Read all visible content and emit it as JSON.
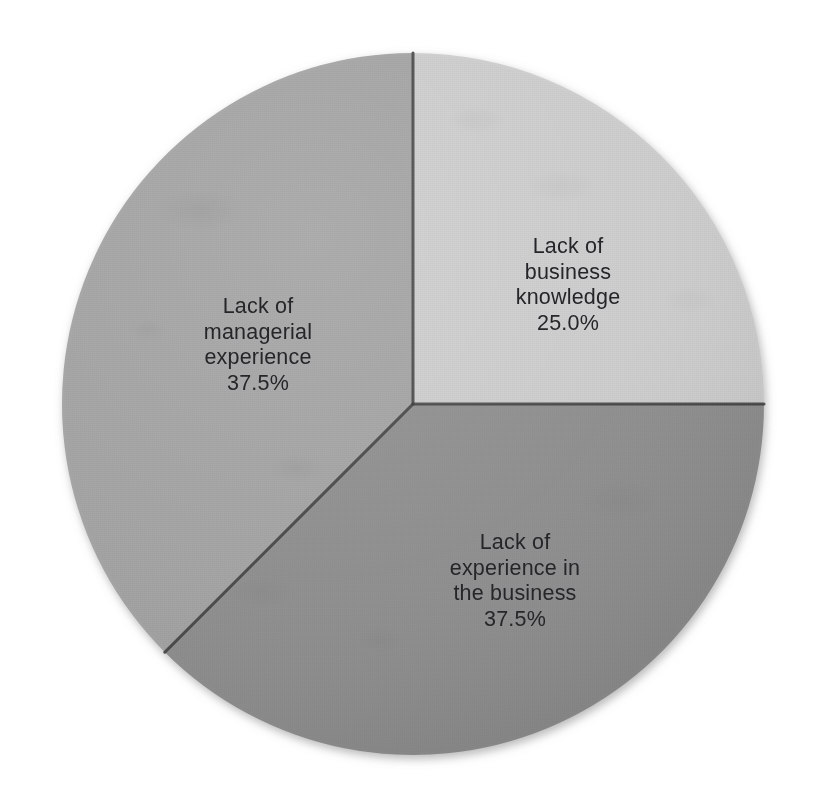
{
  "chart_data": {
    "type": "pie",
    "title": "",
    "subtitle": "",
    "xlabel": "",
    "ylabel": "",
    "legend_position": "none",
    "grid": false,
    "start_angle_deg": 0,
    "direction": "clockwise",
    "categories": [
      "Lack of business knowledge",
      "Lack of experience in the business",
      "Lack of managerial experience"
    ],
    "values": [
      25.0,
      37.5,
      37.5
    ],
    "value_labels": [
      "25.0%",
      "37.5%",
      "37.5%"
    ],
    "colors": [
      "#cdcdcd",
      "#8e8e8e",
      "#a3a3a3"
    ],
    "slices": [
      {
        "label": "Lack of business knowledge",
        "label_lines": [
          "Lack of",
          "business",
          "knowledge"
        ],
        "value": 25.0,
        "value_label": "25.0%",
        "color": "#cdcdcd",
        "start_angle_deg": 0,
        "end_angle_deg": 90,
        "label_x": 568,
        "label_y": 285
      },
      {
        "label": "Lack of experience in the business",
        "label_lines": [
          "Lack of",
          "experience in",
          "the business"
        ],
        "value": 37.5,
        "value_label": "37.5%",
        "color": "#8e8e8e",
        "start_angle_deg": 90,
        "end_angle_deg": 225,
        "label_x": 515,
        "label_y": 581
      },
      {
        "label": "Lack of managerial experience",
        "label_lines": [
          "Lack of",
          "managerial",
          "experience"
        ],
        "value": 37.5,
        "value_label": "37.5%",
        "color": "#a3a3a3",
        "start_angle_deg": 225,
        "end_angle_deg": 360,
        "label_x": 258,
        "label_y": 345
      }
    ],
    "geometry": {
      "center_x": 413,
      "center_y": 404,
      "radius": 351,
      "divider_color": "#3a3a3a",
      "background": "#ffffff"
    }
  }
}
